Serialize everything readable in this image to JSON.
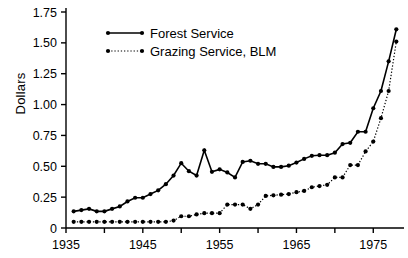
{
  "chart_data": {
    "type": "line",
    "title": "",
    "xlabel": "",
    "ylabel": "Dollars",
    "xlim": [
      1935,
      1979
    ],
    "ylim": [
      0,
      1.75
    ],
    "grid": false,
    "legend_position": "top-left-inside",
    "xticks": [
      1935,
      1945,
      1955,
      1965,
      1975
    ],
    "xtick_labels": [
      "1935",
      "1945",
      "1955",
      "1965",
      "1975"
    ],
    "xminor_ticks": [
      1940,
      1950,
      1960,
      1970
    ],
    "yticks": [
      0,
      0.25,
      0.5,
      0.75,
      1.0,
      1.25,
      1.5,
      1.75
    ],
    "ytick_labels": [
      "0",
      "0.25",
      "0.50",
      "0.75",
      "1.00",
      "1.25",
      "1.50",
      "1.75"
    ],
    "x": [
      1936,
      1937,
      1938,
      1939,
      1940,
      1941,
      1942,
      1943,
      1944,
      1945,
      1946,
      1947,
      1948,
      1949,
      1950,
      1951,
      1952,
      1953,
      1954,
      1955,
      1956,
      1957,
      1958,
      1959,
      1960,
      1961,
      1962,
      1963,
      1964,
      1965,
      1966,
      1967,
      1968,
      1969,
      1970,
      1971,
      1972,
      1973,
      1974,
      1975,
      1976,
      1977,
      1978
    ],
    "series": [
      {
        "name": "Forest Service",
        "style": "solid",
        "marker": "filled-circle",
        "values": [
          0.135,
          0.145,
          0.155,
          0.135,
          0.135,
          0.155,
          0.175,
          0.215,
          0.245,
          0.245,
          0.275,
          0.305,
          0.355,
          0.425,
          0.525,
          0.46,
          0.425,
          0.63,
          0.455,
          0.475,
          0.45,
          0.41,
          0.535,
          0.545,
          0.52,
          0.52,
          0.495,
          0.495,
          0.505,
          0.53,
          0.56,
          0.585,
          0.59,
          0.59,
          0.61,
          0.68,
          0.69,
          0.78,
          0.78,
          0.97,
          1.11,
          1.35,
          1.61
        ]
      },
      {
        "name": "Grazing Service, BLM",
        "style": "dotted",
        "marker": "filled-circle",
        "values": [
          0.05,
          0.05,
          0.05,
          0.05,
          0.05,
          0.05,
          0.05,
          0.05,
          0.05,
          0.05,
          0.05,
          0.05,
          0.05,
          0.06,
          0.095,
          0.095,
          0.11,
          0.12,
          0.12,
          0.12,
          0.19,
          0.19,
          0.19,
          0.155,
          0.19,
          0.26,
          0.265,
          0.27,
          0.275,
          0.29,
          0.3,
          0.33,
          0.34,
          0.35,
          0.41,
          0.41,
          0.51,
          0.51,
          0.62,
          0.7,
          0.89,
          1.11,
          1.51
        ]
      }
    ]
  },
  "axis": {
    "ylabel": "Dollars"
  },
  "legend": {
    "items": [
      {
        "label": "Forest Service"
      },
      {
        "label": "Grazing Service, BLM"
      }
    ]
  }
}
